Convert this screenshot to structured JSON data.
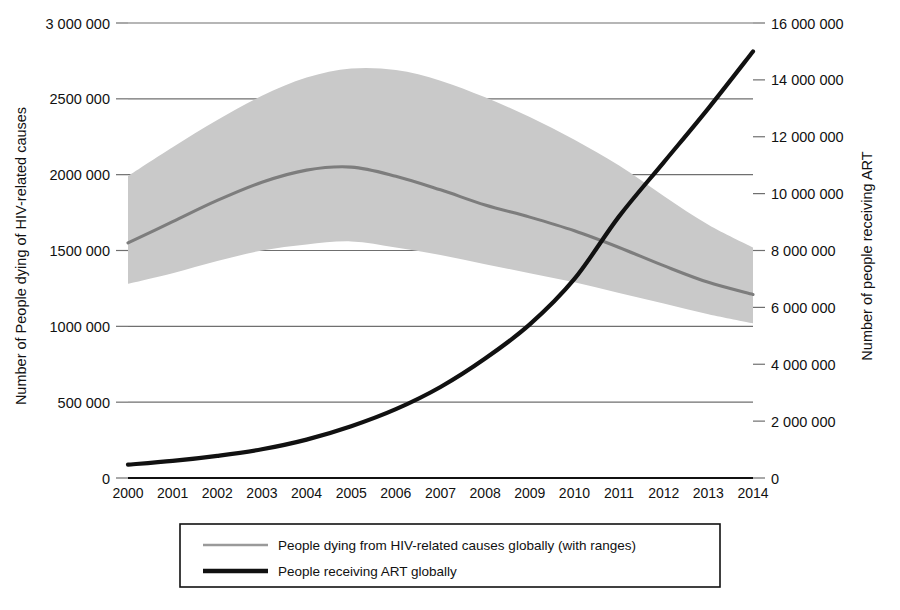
{
  "chart_data": {
    "type": "line",
    "title": "",
    "subtitle": "",
    "xlabel": "",
    "ylabel": "Number of People dying of HIV-related causes",
    "y2label": "Number of people receiving ART",
    "grid": true,
    "legend_position": "bottom",
    "x": [
      2000,
      2001,
      2002,
      2003,
      2004,
      2005,
      2006,
      2007,
      2008,
      2009,
      2010,
      2011,
      2012,
      2013,
      2014
    ],
    "xlim": [
      2000,
      2014
    ],
    "xticklabels": [
      "2000",
      "2001",
      "2002",
      "2003",
      "2004",
      "2005",
      "2006",
      "2007",
      "2008",
      "2009",
      "2010",
      "2011",
      "2012",
      "2013",
      "2014"
    ],
    "ylim": [
      0,
      3000000
    ],
    "yticks": [
      0,
      500000,
      1000000,
      1500000,
      2000000,
      2500000,
      3000000
    ],
    "yticklabels": [
      "0",
      "500 000",
      "1000 000",
      "1500 000",
      "2000 000",
      "2500 000",
      "3 000 000"
    ],
    "y2lim": [
      0,
      16000000
    ],
    "y2ticks": [
      0,
      2000000,
      4000000,
      6000000,
      8000000,
      10000000,
      12000000,
      14000000,
      16000000
    ],
    "y2ticklabels": [
      "0",
      "2 000 000",
      "4 000 000",
      "6 000 000",
      "8 000 000",
      "10 000 000",
      "12 000 000",
      "14 000 000",
      "16 000 000"
    ],
    "series": [
      {
        "name": "People dying from HIV-related causes globally (with ranges)",
        "axis": "left",
        "color": "#7d7d7d",
        "values": [
          1550000,
          1690000,
          1830000,
          1950000,
          2030000,
          2050000,
          1990000,
          1900000,
          1800000,
          1720000,
          1630000,
          1520000,
          1400000,
          1290000,
          1210000
        ],
        "range_upper": [
          1990000,
          2180000,
          2360000,
          2520000,
          2640000,
          2700000,
          2690000,
          2620000,
          2510000,
          2380000,
          2230000,
          2060000,
          1860000,
          1670000,
          1520000
        ],
        "range_lower": [
          1280000,
          1350000,
          1430000,
          1500000,
          1540000,
          1560000,
          1520000,
          1470000,
          1410000,
          1350000,
          1290000,
          1220000,
          1150000,
          1080000,
          1020000
        ]
      },
      {
        "name": "People receiving ART globally",
        "axis": "right",
        "color": "#111111",
        "values": [
          470000,
          600000,
          780000,
          1010000,
          1350000,
          1820000,
          2420000,
          3200000,
          4200000,
          5400000,
          7000000,
          9200000,
          11100000,
          13000000,
          15000000
        ]
      }
    ],
    "crossing_note": "Series cross near 2010"
  },
  "legend": {
    "items": [
      {
        "label": "People dying from HIV-related causes globally (with ranges)",
        "color": "#7d7d7d",
        "swatch": "thin-gray-line"
      },
      {
        "label": "People receiving ART globally",
        "color": "#111111",
        "swatch": "thick-black-line"
      }
    ]
  },
  "colors": {
    "band": "#c9c9c9",
    "deaths_line": "#7d7d7d",
    "art_line": "#111111",
    "grid": "#6f6f6f",
    "axis": "#111111",
    "text": "#111111",
    "background": "#ffffff"
  }
}
